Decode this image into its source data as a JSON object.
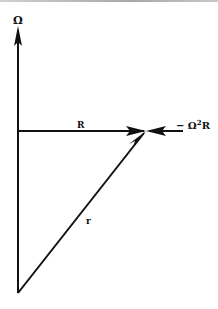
{
  "diagram": {
    "type": "vector-diagram",
    "labels": {
      "omega": "Ω",
      "R": "R",
      "r": "r",
      "centripetal": "− Ω",
      "centripetal_exp": "2",
      "centripetal_suffix": "R"
    },
    "vectors": [
      {
        "name": "Omega",
        "from": [
          18,
          293
        ],
        "to": [
          18,
          28
        ],
        "label": "Ω"
      },
      {
        "name": "R",
        "from": [
          18,
          131
        ],
        "to": [
          146,
          131
        ],
        "label": "R"
      },
      {
        "name": "r",
        "from": [
          18,
          293
        ],
        "to": [
          146,
          131
        ],
        "label": "r"
      },
      {
        "name": "minus-omega-squared-R",
        "from": [
          183,
          131
        ],
        "to": [
          146,
          131
        ],
        "label": "− Ω²R"
      }
    ],
    "colors": {
      "stroke": "#111111",
      "background": "#ffffff"
    }
  }
}
